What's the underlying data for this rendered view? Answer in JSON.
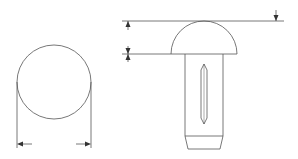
{
  "diagram": {
    "type": "technical-drawing",
    "views": [
      {
        "name": "top-view",
        "shape": "circle",
        "dimension": "diameter (horizontal arrows below)"
      },
      {
        "name": "side-view",
        "shape": "dome head with split shank",
        "dimensions": [
          "total head height (top arrows)",
          "head thickness (small arrows)"
        ]
      }
    ],
    "colors": {
      "line": "#555555",
      "background": "#ffffff"
    }
  }
}
